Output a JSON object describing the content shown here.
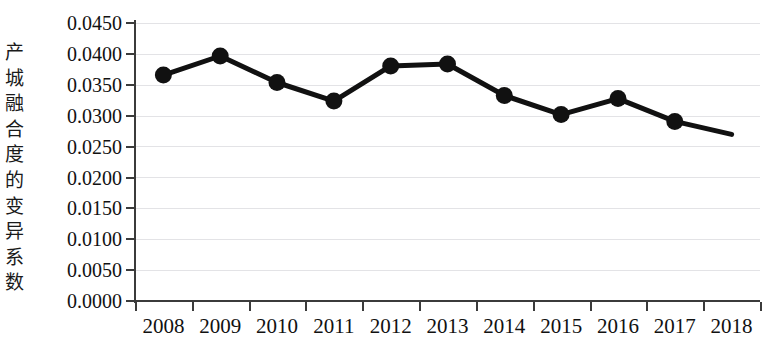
{
  "chart_data": {
    "type": "line",
    "title": "",
    "subtitle": "",
    "xlabel": "",
    "ylabel": "产城融合度的变异系数",
    "ylabel_chars": [
      "产",
      "城",
      "融",
      "合",
      "度",
      "的",
      "变",
      "异",
      "系",
      "数"
    ],
    "categories": [
      "2008",
      "2009",
      "2010",
      "2011",
      "2012",
      "2013",
      "2014",
      "2015",
      "2016",
      "2017",
      "2018"
    ],
    "values": [
      0.0366,
      0.0397,
      0.0354,
      0.0324,
      0.0381,
      0.0384,
      0.0333,
      0.0302,
      0.0328,
      0.0291,
      0.027
    ],
    "series": [
      {
        "name": "产城融合度的变异系数",
        "values": [
          0.0366,
          0.0397,
          0.0354,
          0.0324,
          0.0381,
          0.0384,
          0.0333,
          0.0302,
          0.0328,
          0.0291,
          0.027
        ]
      }
    ],
    "ylim": [
      0.0,
      0.045
    ],
    "ytick_labels": [
      "0.0450",
      "0.0400",
      "0.0350",
      "0.0300",
      "0.0250",
      "0.0200",
      "0.0150",
      "0.0100",
      "0.0050",
      "0.0000"
    ],
    "ytick_values": [
      0.045,
      0.04,
      0.035,
      0.03,
      0.025,
      0.02,
      0.015,
      0.01,
      0.005,
      0
    ],
    "grid": true,
    "grid_axis": "y",
    "legend": false,
    "legend_position": "none",
    "line_color": "#111111",
    "marker_color": "#111111",
    "marker_shape": "circle",
    "gridline_color": "#e3e3e6",
    "axis_color": "#3b3b3b",
    "annotations": []
  }
}
